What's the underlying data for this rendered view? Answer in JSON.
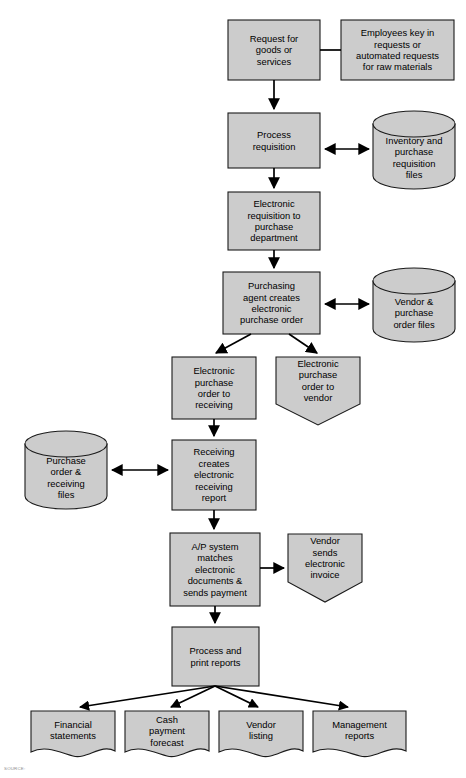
{
  "diagram": {
    "colors": {
      "shape_fill": "#cccccc",
      "shape_stroke": "#1a1a1a",
      "connector": "#000000",
      "background": "#ffffff",
      "caption_text": "#8d8d8d"
    },
    "nodes": [
      {
        "id": "request-for-goods",
        "shape": "process",
        "label": "Request for\ngoods or\nservices",
        "x": 228,
        "y": 20,
        "w": 92,
        "h": 60
      },
      {
        "id": "employees-key-in-requests",
        "shape": "process",
        "label": "Employees key in\nrequests or\nautomated requests\nfor raw materials",
        "x": 341,
        "y": 20,
        "w": 113,
        "h": 60
      },
      {
        "id": "process-requisition",
        "shape": "process",
        "label": "Process\nrequisition",
        "x": 228,
        "y": 113,
        "w": 92,
        "h": 55
      },
      {
        "id": "inventory-purchase-requisition-files",
        "shape": "cylinder",
        "label": "Inventory and\npurchase\nrequisition\nfiles",
        "x": 373,
        "y": 111,
        "w": 82,
        "h": 78
      },
      {
        "id": "electronic-requisition-to-purchase-dept",
        "shape": "process",
        "label": "Electronic\nrequisition to\npurchase\ndepartment",
        "x": 228,
        "y": 192,
        "w": 92,
        "h": 58
      },
      {
        "id": "purchasing-agent-creates-po",
        "shape": "process",
        "label": "Purchasing\nagent creates\nelectronic\npurchase order",
        "x": 223,
        "y": 272,
        "w": 97,
        "h": 62
      },
      {
        "id": "vendor-purchase-order-files",
        "shape": "cylinder",
        "label": "Vendor &\npurchase\norder files",
        "x": 373,
        "y": 268,
        "w": 82,
        "h": 74
      },
      {
        "id": "epo-to-receiving",
        "shape": "process",
        "label": "Electronic\npurchase\norder to\nreceiving",
        "x": 172,
        "y": 357,
        "w": 84,
        "h": 62
      },
      {
        "id": "epo-to-vendor",
        "shape": "pennant",
        "label": "Electronic\npurchase\norder to\nvendor",
        "x": 276,
        "y": 357,
        "w": 84,
        "h": 68
      },
      {
        "id": "purchase-order-receiving-files",
        "shape": "cylinder",
        "label": "Purchase\norder &\nreceiving\nfiles",
        "x": 25,
        "y": 431,
        "w": 82,
        "h": 78
      },
      {
        "id": "receiving-creates-report",
        "shape": "process",
        "label": "Receiving\ncreates\nelectronic\nreceiving\nreport",
        "x": 172,
        "y": 440,
        "w": 84,
        "h": 70
      },
      {
        "id": "ap-system-matches",
        "shape": "process",
        "label": "A/P system\nmatches\nelectronic\ndocuments &\nsends payment",
        "x": 170,
        "y": 533,
        "w": 90,
        "h": 73
      },
      {
        "id": "vendor-sends-invoice",
        "shape": "pennant",
        "label": "Vendor\nsends\nelectronic\ninvoice",
        "x": 288,
        "y": 534,
        "w": 74,
        "h": 68
      },
      {
        "id": "process-and-print-reports",
        "shape": "process",
        "label": "Process and\nprint reports",
        "x": 172,
        "y": 627,
        "w": 87,
        "h": 59
      },
      {
        "id": "financial-statements",
        "shape": "document",
        "label": "Financial\nstatements",
        "x": 31,
        "y": 711,
        "w": 84,
        "h": 49
      },
      {
        "id": "cash-payment-forecast",
        "shape": "document",
        "label": "Cash\npayment\nforecast",
        "x": 125,
        "y": 711,
        "w": 84,
        "h": 49
      },
      {
        "id": "vendor-listing",
        "shape": "document",
        "label": "Vendor\nlisting",
        "x": 219,
        "y": 711,
        "w": 84,
        "h": 49
      },
      {
        "id": "management-reports",
        "shape": "document",
        "label": "Management\nreports",
        "x": 313,
        "y": 711,
        "w": 93,
        "h": 49
      }
    ],
    "connectors": [
      {
        "id": "request-to-employees",
        "kind": "line",
        "arrows": "none"
      },
      {
        "id": "request-to-process-requisition",
        "kind": "line",
        "arrows": "end"
      },
      {
        "id": "process-requisition-to-inventory-files",
        "kind": "line",
        "arrows": "both"
      },
      {
        "id": "process-requisition-to-electronic-requisition",
        "kind": "line",
        "arrows": "end"
      },
      {
        "id": "electronic-requisition-to-purchasing-agent",
        "kind": "line",
        "arrows": "end"
      },
      {
        "id": "purchasing-agent-to-vendor-files",
        "kind": "line",
        "arrows": "both"
      },
      {
        "id": "purchasing-agent-to-epo-receiving",
        "kind": "line",
        "arrows": "end"
      },
      {
        "id": "purchasing-agent-to-epo-vendor",
        "kind": "line",
        "arrows": "end"
      },
      {
        "id": "epo-receiving-to-receiving-creates",
        "kind": "line",
        "arrows": "end"
      },
      {
        "id": "po-receiving-files-to-receiving-creates",
        "kind": "line",
        "arrows": "both"
      },
      {
        "id": "receiving-creates-to-ap-system",
        "kind": "line",
        "arrows": "end"
      },
      {
        "id": "ap-system-to-vendor-invoice",
        "kind": "line",
        "arrows": "end"
      },
      {
        "id": "ap-system-to-process-print",
        "kind": "line",
        "arrows": "end"
      },
      {
        "id": "process-print-to-financial-statements",
        "kind": "line",
        "arrows": "end"
      },
      {
        "id": "process-print-to-cash-payment-forecast",
        "kind": "line",
        "arrows": "end"
      },
      {
        "id": "process-print-to-vendor-listing",
        "kind": "line",
        "arrows": "end"
      },
      {
        "id": "process-print-to-management-reports",
        "kind": "line",
        "arrows": "end"
      }
    ],
    "caption": "SOURCE:"
  }
}
